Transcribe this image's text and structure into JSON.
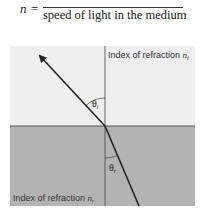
{
  "formula": {
    "lhs": "n",
    "equals": "=",
    "denominator": "speed of light in the medium",
    "period": "."
  },
  "diagram": {
    "top_medium_label": "Index of refraction",
    "top_medium_symbol": "n",
    "top_medium_subscript": "i",
    "bottom_medium_label": "Index of refraction",
    "bottom_medium_symbol": "n",
    "bottom_medium_subscript": "r",
    "incident_angle_symbol": "θ",
    "incident_angle_subscript": "i",
    "refracted_angle_symbol": "θ",
    "refracted_angle_subscript": "r",
    "colors": {
      "top_medium": "#efefef",
      "bottom_medium": "#b3b3b3",
      "lines": "#222222",
      "interface": "#555555"
    }
  }
}
